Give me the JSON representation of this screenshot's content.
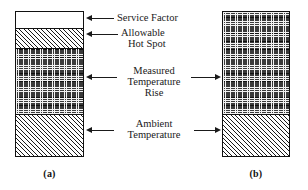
{
  "figure": {
    "bars": [
      {
        "caption": "(a)",
        "segments": [
          {
            "name": "service-factor",
            "label": "Service Factor",
            "fill": "plain"
          },
          {
            "name": "allowable-hot-spot",
            "label": "Allowable Hot Spot",
            "fill": "diagonal-hatch"
          },
          {
            "name": "measured-temperature-rise",
            "label": "Measured Temperature Rise",
            "fill": "cross-hatch"
          },
          {
            "name": "ambient-temperature",
            "label": "Ambient Temperature",
            "fill": "diagonal-hatch"
          }
        ]
      },
      {
        "caption": "(b)",
        "segments": [
          {
            "name": "measured-temperature-rise",
            "label": "Measured Temperature Rise",
            "fill": "cross-hatch"
          },
          {
            "name": "ambient-temperature",
            "label": "Ambient Temperature",
            "fill": "diagonal-hatch"
          }
        ]
      }
    ],
    "callouts": [
      {
        "name": "service-factor",
        "line1": "Service Factor",
        "line2": "",
        "line3": ""
      },
      {
        "name": "allowable-hot-spot",
        "line1": "Allowable",
        "line2": "Hot Spot",
        "line3": ""
      },
      {
        "name": "measured-temperature-rise",
        "line1": "Measured",
        "line2": "Temperature",
        "line3": "Rise"
      },
      {
        "name": "ambient-temperature",
        "line1": "Ambient",
        "line2": "Temperature",
        "line3": ""
      }
    ],
    "colors": {
      "outline": "#111111",
      "hatch": "#1a1a1a",
      "crosshatch_background": "#3a3a3a",
      "page_background": "#ffffff"
    }
  }
}
